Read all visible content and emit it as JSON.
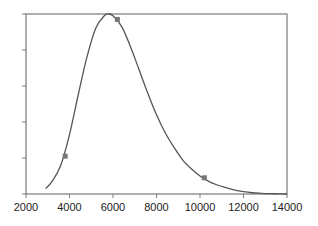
{
  "chart_data": {
    "type": "line",
    "title": "",
    "xlabel": "",
    "ylabel": "",
    "xlim": [
      2000,
      14000
    ],
    "ylim": [
      0,
      1
    ],
    "grid": false,
    "legend": null,
    "x_ticks": [
      "2000",
      "4000",
      "6000",
      "8000",
      "10000",
      "12000",
      "14000"
    ],
    "y_ticks_count": 6,
    "y_tick_labels_visible": false,
    "series": [
      {
        "name": "curve",
        "style": "smooth line",
        "color": "#555555",
        "x": [
          2900,
          3200,
          3600,
          4000,
          4400,
          4800,
          5200,
          5600,
          5800,
          6000,
          6400,
          6800,
          7200,
          7600,
          8000,
          8400,
          8800,
          9200,
          9600,
          10000,
          10400,
          10800,
          11200,
          11600,
          12000,
          12400,
          12800,
          13200,
          13600,
          14000
        ],
        "y": [
          0.03,
          0.07,
          0.16,
          0.33,
          0.55,
          0.76,
          0.92,
          0.99,
          1.0,
          0.99,
          0.93,
          0.82,
          0.69,
          0.56,
          0.44,
          0.34,
          0.26,
          0.19,
          0.14,
          0.1,
          0.07,
          0.05,
          0.035,
          0.022,
          0.013,
          0.007,
          0.004,
          0.002,
          0.001,
          0.0
        ]
      },
      {
        "name": "markers",
        "style": "square markers",
        "color": "#777777",
        "x": [
          3800,
          6200,
          10200
        ],
        "y": [
          0.21,
          0.97,
          0.09
        ]
      }
    ]
  }
}
